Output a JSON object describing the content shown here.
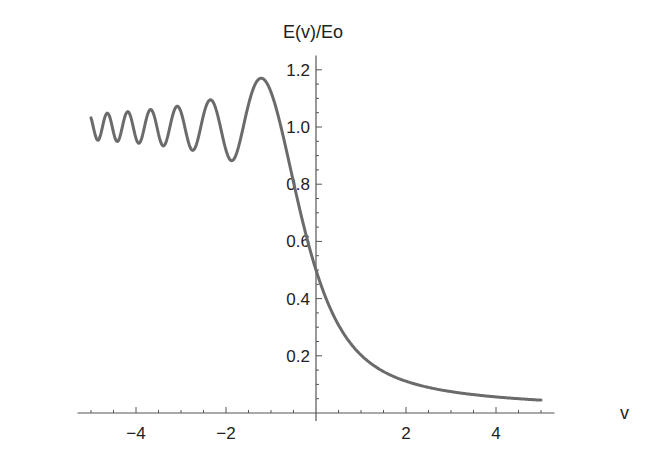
{
  "chart_data": {
    "type": "line",
    "title": "",
    "xlabel": "v",
    "ylabel": "E(v)/Eo",
    "xlim": [
      -5.2,
      5.2
    ],
    "ylim": [
      0,
      1.22
    ],
    "x_ticks": [
      -4,
      -2,
      2,
      4
    ],
    "x_tick_labels": [
      "−4",
      "−2",
      "2",
      "4"
    ],
    "y_ticks": [
      0.2,
      0.4,
      0.6,
      0.8,
      1.0,
      1.2
    ],
    "y_tick_labels": [
      "0.2",
      "0.4",
      "0.6",
      "0.8",
      "1.0",
      "1.2"
    ],
    "grid": false,
    "legend": null,
    "line_color": "#6b6b6b",
    "series": [
      {
        "name": "E(v)/Eo",
        "x": [
          -5.0,
          -4.75,
          -4.5,
          -4.25,
          -4.0,
          -3.75,
          -3.5,
          -3.25,
          -3.0,
          -2.75,
          -2.5,
          -2.25,
          -2.0,
          -1.75,
          -1.5,
          -1.25,
          -1.0,
          -0.75,
          -0.5,
          -0.25,
          0.0,
          0.5,
          1.0,
          1.5,
          2.0,
          2.5,
          3.0,
          3.5,
          4.0,
          4.5,
          5.0
        ],
        "values": [
          1.03,
          0.96,
          1.04,
          0.95,
          1.05,
          0.94,
          1.06,
          0.93,
          1.07,
          0.92,
          1.08,
          0.91,
          0.9,
          1.05,
          1.16,
          1.17,
          1.09,
          0.94,
          0.75,
          0.62,
          0.5,
          0.34,
          0.24,
          0.17,
          0.13,
          0.1,
          0.09,
          0.075,
          0.065,
          0.058,
          0.052
        ]
      }
    ]
  }
}
